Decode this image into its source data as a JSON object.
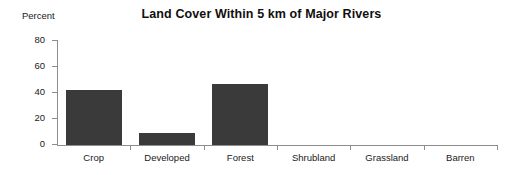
{
  "chart_data": {
    "type": "bar",
    "title": "Land Cover Within 5 km of Major Rivers",
    "xlabel": "",
    "ylabel": "Percent",
    "categories": [
      "Crop",
      "Developed",
      "Forest",
      "Shrubland",
      "Grassland",
      "Barren"
    ],
    "values": [
      42,
      9,
      47,
      0,
      0,
      0
    ],
    "ylim": [
      0,
      80
    ],
    "yticks": [
      0,
      20,
      40,
      60,
      80
    ],
    "ytick_labels": [
      "0",
      "20",
      "40",
      "60",
      "80"
    ],
    "grid": false,
    "legend": null,
    "bar_color": "#3a3a3a",
    "axis_color": "#8d8d8d",
    "background_color": "#ffffff"
  }
}
